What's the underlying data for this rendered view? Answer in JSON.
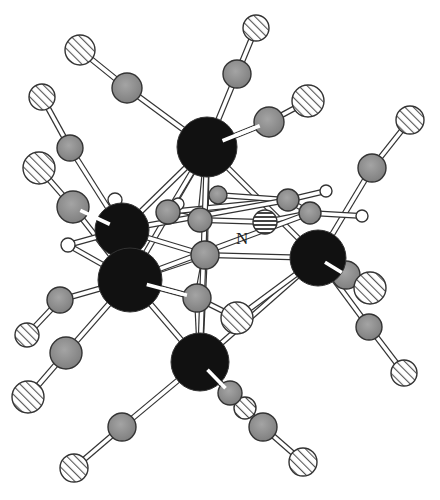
{
  "figure": {
    "type": "ball-and-stick molecular structure",
    "label_N": "N",
    "colors": {
      "metal": "#111111",
      "carbon": "#8e8e8e",
      "oxygen_hatch": "#555555",
      "hydrogen": "#ffffff",
      "bond": "#ffffff",
      "outline": "#333333"
    },
    "legend": {
      "metal": "black sphere",
      "carbon": "grey sphere",
      "oxygen": "diagonally hatched sphere",
      "nitrogen": "horizontally hatched sphere",
      "hydrogen": "small white sphere"
    }
  }
}
